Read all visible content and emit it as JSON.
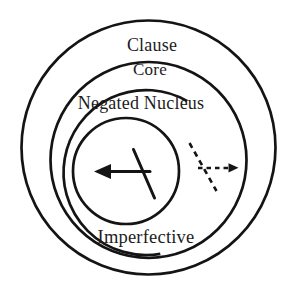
{
  "diagram": {
    "labels": {
      "outer_ring": "Clause",
      "core_ring": "Core",
      "negated_nucleus": "Negated Nucleus",
      "imperfective": "Imperfective"
    },
    "icons": {
      "nucleus_operator": "negation-arrow-solid-icon",
      "core_operator": "negation-arrow-dashed-icon"
    },
    "colors": {
      "line": "#141414",
      "text": "#1c1c1c",
      "background": "#ffffff"
    }
  }
}
